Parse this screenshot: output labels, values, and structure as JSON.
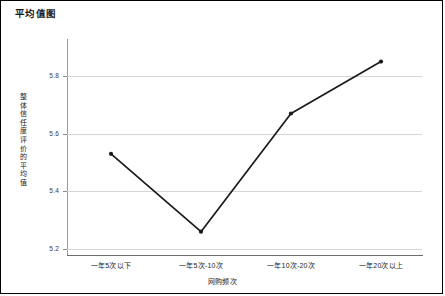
{
  "chart_data": {
    "type": "line",
    "title": "平均值图",
    "xlabel": "网购频次",
    "ylabel": "整体信任度评价的平均值",
    "categories": [
      "一年5次以下",
      "一年5次-10次",
      "一年10次-20次",
      "一年20次以上"
    ],
    "values": [
      5.53,
      5.26,
      5.67,
      5.85
    ],
    "series": [
      {
        "name": "整体信任度评价的平均值",
        "values": [
          5.53,
          5.26,
          5.67,
          5.85
        ]
      }
    ],
    "yticks": [
      "5.8",
      "5.6",
      "5.4",
      "5.2"
    ],
    "ytick_values": [
      5.8,
      5.6,
      5.4,
      5.2
    ],
    "ylim": [
      5.15,
      5.9
    ],
    "grid": true,
    "legend": "none",
    "marker": "dot",
    "line_color": "#1a1a1a",
    "grid_color": "#d6d6d6",
    "axis_color": "#6e6e6e",
    "border_color": "#000000"
  }
}
